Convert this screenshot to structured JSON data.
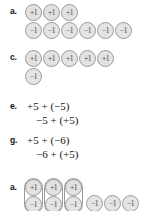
{
  "page": {
    "width": 164,
    "height": 211,
    "background": "#ffffff",
    "chip_fill": "#e2e2e2",
    "chip_border": "#9a9a9a",
    "text_color": "#141414"
  },
  "chip_labels": {
    "positive": "+1",
    "negative": "−1"
  },
  "problems": [
    {
      "id": "a-top",
      "label": "a.",
      "type": "chips",
      "rows": [
        {
          "sign": "positive",
          "count": 3
        },
        {
          "sign": "negative",
          "count": 6
        }
      ]
    },
    {
      "id": "c",
      "label": "c.",
      "type": "chips",
      "rows": [
        {
          "sign": "positive",
          "count": 5
        },
        {
          "sign": "negative",
          "count": 1
        }
      ]
    },
    {
      "id": "e",
      "label": "e.",
      "type": "equations",
      "lines": [
        "+5 + (−5)",
        "−5 + (+5)"
      ]
    },
    {
      "id": "g",
      "label": "g.",
      "type": "equations",
      "lines": [
        "+5 + (−6)",
        "−6 + (+5)"
      ]
    },
    {
      "id": "a-bottom",
      "label": "a.",
      "type": "zero-pairs",
      "pairs": 3,
      "loose": {
        "sign": "negative",
        "count": 3
      }
    }
  ]
}
